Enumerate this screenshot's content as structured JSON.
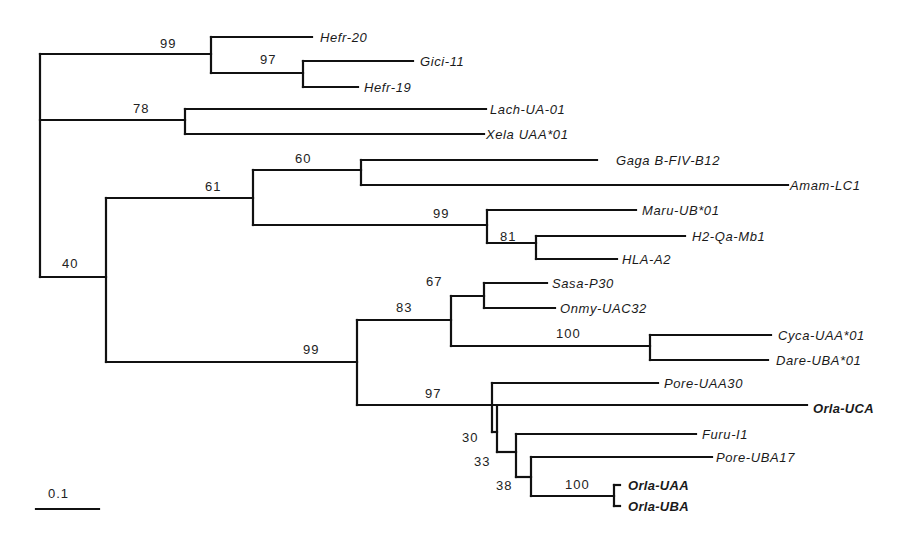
{
  "figure": {
    "type": "phylogenetic-tree",
    "scale_bar": {
      "label": "0.1",
      "x1": 36,
      "x2": 99,
      "y": 509
    },
    "taxa": [
      {
        "id": "hefr20",
        "label": "Hefr-20",
        "bold": false,
        "x": 320,
        "y": 37
      },
      {
        "id": "gici11",
        "label": "Gici-11",
        "bold": false,
        "x": 420,
        "y": 61
      },
      {
        "id": "hefr19",
        "label": "Hefr-19",
        "bold": false,
        "x": 364,
        "y": 87
      },
      {
        "id": "lach",
        "label": "Lach-UA-01",
        "bold": false,
        "x": 490,
        "y": 109
      },
      {
        "id": "xela",
        "label": "Xela UAA*01",
        "bold": false,
        "x": 486,
        "y": 134
      },
      {
        "id": "gaga",
        "label": "Gaga B-FIV-B12",
        "bold": false,
        "x": 616,
        "y": 160
      },
      {
        "id": "amam",
        "label": "Amam-LC1",
        "bold": false,
        "x": 790,
        "y": 185
      },
      {
        "id": "maru",
        "label": "Maru-UB*01",
        "bold": false,
        "x": 642,
        "y": 210
      },
      {
        "id": "h2qa",
        "label": "H2-Qa-Mb1",
        "bold": false,
        "x": 692,
        "y": 236
      },
      {
        "id": "hla",
        "label": "HLA-A2",
        "bold": false,
        "x": 622,
        "y": 259
      },
      {
        "id": "sasa",
        "label": "Sasa-P30",
        "bold": false,
        "x": 552,
        "y": 283
      },
      {
        "id": "onmy",
        "label": "Onmy-UAC32",
        "bold": false,
        "x": 560,
        "y": 308
      },
      {
        "id": "cyca",
        "label": "Cyca-UAA*01",
        "bold": false,
        "x": 778,
        "y": 335
      },
      {
        "id": "dare",
        "label": "Dare-UBA*01",
        "bold": false,
        "x": 776,
        "y": 360
      },
      {
        "id": "poreuaa",
        "label": "Pore-UAA30",
        "bold": false,
        "x": 664,
        "y": 383
      },
      {
        "id": "orlauca",
        "label": "Orla-UCA",
        "bold": true,
        "x": 813,
        "y": 408
      },
      {
        "id": "furu",
        "label": "Furu-I1",
        "bold": false,
        "x": 702,
        "y": 434
      },
      {
        "id": "poreuba",
        "label": "Pore-UBA17",
        "bold": false,
        "x": 716,
        "y": 457
      },
      {
        "id": "orlauaa",
        "label": "Orla-UAA",
        "bold": true,
        "x": 628,
        "y": 485
      },
      {
        "id": "orlauba",
        "label": "Orla-UBA",
        "bold": true,
        "x": 628,
        "y": 506
      }
    ],
    "support_values": [
      {
        "label": "99",
        "x": 160,
        "y": 48
      },
      {
        "label": "97",
        "x": 260,
        "y": 64
      },
      {
        "label": "78",
        "x": 133,
        "y": 113
      },
      {
        "label": "60",
        "x": 295,
        "y": 163
      },
      {
        "label": "61",
        "x": 205,
        "y": 191
      },
      {
        "label": "99",
        "x": 433,
        "y": 218
      },
      {
        "label": "81",
        "x": 500,
        "y": 241
      },
      {
        "label": "40",
        "x": 62,
        "y": 268
      },
      {
        "label": "67",
        "x": 426,
        "y": 286
      },
      {
        "label": "83",
        "x": 396,
        "y": 312
      },
      {
        "label": "100",
        "x": 556,
        "y": 338
      },
      {
        "label": "99",
        "x": 303,
        "y": 354
      },
      {
        "label": "97",
        "x": 425,
        "y": 398
      },
      {
        "label": "30",
        "x": 462,
        "y": 442
      },
      {
        "label": "33",
        "x": 474,
        "y": 466
      },
      {
        "label": "38",
        "x": 496,
        "y": 490
      },
      {
        "label": "100",
        "x": 565,
        "y": 489
      }
    ],
    "branches": [
      "M40,54 L40,277",
      "M40,54 L211,54",
      "M211,37 L211,73",
      "M211,37 L312,37",
      "M211,73 L303,73",
      "M303,61 L303,87",
      "M303,61 L413,61",
      "M303,87 L358,87",
      "M40,120 L185,120",
      "M185,109 L185,134",
      "M185,109 L486,109",
      "M185,134 L484,134",
      "M40,277 L106,277",
      "M106,198 L106,362",
      "M106,198 L253,198",
      "M253,170 L253,225",
      "M253,170 L361,170",
      "M361,160 L361,185",
      "M361,160 L597,160",
      "M361,185 L788,185",
      "M253,225 L487,225",
      "M487,210 L487,243",
      "M487,210 L636,210",
      "M487,243 L536,243",
      "M536,236 L536,259",
      "M536,236 L685,236",
      "M536,259 L617,259",
      "M106,362 L357,362",
      "M357,320 L357,405",
      "M357,320 L451,320",
      "M451,296 L451,346",
      "M451,296 L484,296",
      "M484,283 L484,308",
      "M484,283 L547,283",
      "M484,308 L555,308",
      "M451,346 L650,346",
      "M650,335 L650,360",
      "M650,335 L771,335",
      "M650,360 L768,360",
      "M357,405 L807,405",
      "M492,383 L492,432",
      "M492,383 L658,383",
      "M492,432 L497,432",
      "M497,407 L497,452",
      "M497,452 L516,452",
      "M516,434 L516,477",
      "M516,434 L696,434",
      "M516,477 L531,477",
      "M531,457 L531,496",
      "M531,457 L712,457",
      "M531,496 L614,496",
      "M614,485 L614,506",
      "M614,485 L620,485",
      "M614,506 L620,506"
    ]
  }
}
